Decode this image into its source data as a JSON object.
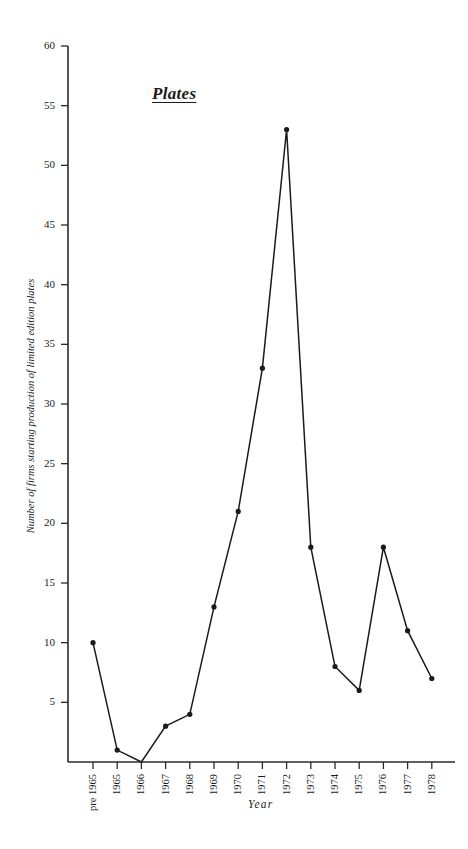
{
  "chart_data": {
    "type": "line",
    "title": "Plates",
    "xlabel": "Year",
    "ylabel": "Number of firms starting production of limited edition plates",
    "categories": [
      "pre 1965",
      "1965",
      "1966",
      "1967",
      "1968",
      "1969",
      "1970",
      "1971",
      "1972",
      "1973",
      "1974",
      "1975",
      "1976",
      "1977",
      "1978"
    ],
    "values": [
      10,
      1,
      0,
      3,
      4,
      13,
      21,
      33,
      53,
      18,
      8,
      6,
      18,
      11,
      7
    ],
    "ylim": [
      0,
      60
    ],
    "yticks": [
      "60",
      "55",
      "50",
      "45",
      "40",
      "35",
      "30",
      "25",
      "20",
      "15",
      "10",
      "5"
    ],
    "ytick_values": [
      60,
      55,
      50,
      45,
      40,
      35,
      30,
      25,
      20,
      15,
      10,
      5
    ],
    "grid": false,
    "legend": "none",
    "marker": "filled-circle",
    "line_color": "#1a1a1a",
    "marker_color": "#1a1a1a",
    "background_color": "#ffffff"
  }
}
